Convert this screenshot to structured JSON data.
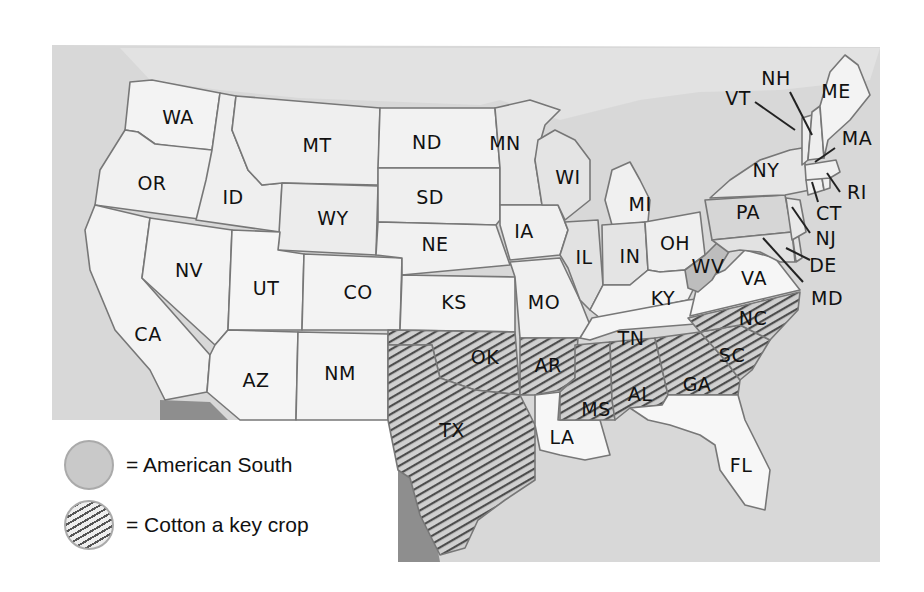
{
  "map": {
    "title": "",
    "colors": {
      "ocean": "#d6d6d6",
      "land_default": "#f4f4f4",
      "american_south": "#cbcbcb",
      "cotton_hatch_line": "#555555",
      "foreign_land": "#8e8e8e",
      "border": "#777777"
    },
    "states": [
      {
        "abbr": "WA",
        "south": false,
        "cotton": false
      },
      {
        "abbr": "OR",
        "south": false,
        "cotton": false
      },
      {
        "abbr": "CA",
        "south": false,
        "cotton": false
      },
      {
        "abbr": "ID",
        "south": false,
        "cotton": false
      },
      {
        "abbr": "NV",
        "south": false,
        "cotton": false
      },
      {
        "abbr": "MT",
        "south": false,
        "cotton": false
      },
      {
        "abbr": "WY",
        "south": false,
        "cotton": false
      },
      {
        "abbr": "UT",
        "south": false,
        "cotton": false
      },
      {
        "abbr": "AZ",
        "south": false,
        "cotton": false
      },
      {
        "abbr": "CO",
        "south": false,
        "cotton": false
      },
      {
        "abbr": "NM",
        "south": false,
        "cotton": false
      },
      {
        "abbr": "ND",
        "south": false,
        "cotton": false
      },
      {
        "abbr": "SD",
        "south": false,
        "cotton": false
      },
      {
        "abbr": "NE",
        "south": false,
        "cotton": false
      },
      {
        "abbr": "KS",
        "south": false,
        "cotton": false
      },
      {
        "abbr": "OK",
        "south": true,
        "cotton": true
      },
      {
        "abbr": "TX",
        "south": true,
        "cotton": true
      },
      {
        "abbr": "MN",
        "south": false,
        "cotton": false
      },
      {
        "abbr": "IA",
        "south": false,
        "cotton": false
      },
      {
        "abbr": "MO",
        "south": false,
        "cotton": false
      },
      {
        "abbr": "AR",
        "south": true,
        "cotton": true
      },
      {
        "abbr": "LA",
        "south": true,
        "cotton": false
      },
      {
        "abbr": "WI",
        "south": false,
        "cotton": false
      },
      {
        "abbr": "IL",
        "south": false,
        "cotton": false
      },
      {
        "abbr": "MI",
        "south": false,
        "cotton": false
      },
      {
        "abbr": "IN",
        "south": false,
        "cotton": false
      },
      {
        "abbr": "OH",
        "south": false,
        "cotton": false
      },
      {
        "abbr": "KY",
        "south": true,
        "cotton": false
      },
      {
        "abbr": "TN",
        "south": true,
        "cotton": false
      },
      {
        "abbr": "MS",
        "south": true,
        "cotton": true
      },
      {
        "abbr": "AL",
        "south": true,
        "cotton": true
      },
      {
        "abbr": "GA",
        "south": true,
        "cotton": true
      },
      {
        "abbr": "FL",
        "south": true,
        "cotton": false
      },
      {
        "abbr": "SC",
        "south": true,
        "cotton": true
      },
      {
        "abbr": "NC",
        "south": true,
        "cotton": true
      },
      {
        "abbr": "VA",
        "south": true,
        "cotton": false
      },
      {
        "abbr": "WV",
        "south": false,
        "cotton": false
      },
      {
        "abbr": "MD",
        "south": false,
        "cotton": false
      },
      {
        "abbr": "DE",
        "south": false,
        "cotton": false
      },
      {
        "abbr": "PA",
        "south": false,
        "cotton": false
      },
      {
        "abbr": "NJ",
        "south": false,
        "cotton": false
      },
      {
        "abbr": "NY",
        "south": false,
        "cotton": false
      },
      {
        "abbr": "CT",
        "south": false,
        "cotton": false
      },
      {
        "abbr": "RI",
        "south": false,
        "cotton": false
      },
      {
        "abbr": "MA",
        "south": false,
        "cotton": false
      },
      {
        "abbr": "VT",
        "south": false,
        "cotton": false
      },
      {
        "abbr": "NH",
        "south": false,
        "cotton": false
      },
      {
        "abbr": "ME",
        "south": false,
        "cotton": false
      }
    ],
    "labels": {
      "WA": "WA",
      "OR": "OR",
      "CA": "CA",
      "ID": "ID",
      "NV": "NV",
      "MT": "MT",
      "WY": "WY",
      "UT": "UT",
      "AZ": "AZ",
      "CO": "CO",
      "NM": "NM",
      "ND": "ND",
      "SD": "SD",
      "NE": "NE",
      "KS": "KS",
      "OK": "OK",
      "TX": "TX",
      "MN": "MN",
      "IA": "IA",
      "MO": "MO",
      "AR": "AR",
      "LA": "LA",
      "WI": "WI",
      "IL": "IL",
      "MI": "MI",
      "IN": "IN",
      "OH": "OH",
      "KY": "KY",
      "TN": "TN",
      "MS": "MS",
      "AL": "AL",
      "GA": "GA",
      "FL": "FL",
      "SC": "SC",
      "NC": "NC",
      "VA": "VA",
      "WV": "WV",
      "MD": "MD",
      "DE": "DE",
      "PA": "PA",
      "NJ": "NJ",
      "NY": "NY",
      "CT": "CT",
      "RI": "RI",
      "MA": "MA",
      "VT": "VT",
      "NH": "NH",
      "ME": "ME"
    }
  },
  "legend": {
    "items": [
      {
        "label": "= American South",
        "swatch": "solid-gray"
      },
      {
        "label": "= Cotton a key crop",
        "swatch": "diagonal-hatch"
      }
    ]
  }
}
